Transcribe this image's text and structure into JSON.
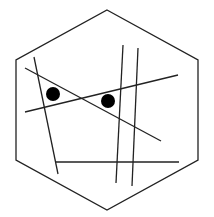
{
  "diagram": {
    "stroke_color": "#222222",
    "dot_color": "#000000",
    "background": "#ffffff",
    "hexagon": {
      "points": [
        [
          107,
          10
        ],
        [
          198,
          60
        ],
        [
          198,
          160
        ],
        [
          107,
          210
        ],
        [
          16,
          160
        ],
        [
          16,
          60
        ]
      ],
      "stroke_width": 1.3
    },
    "lines": [
      {
        "id": "line-a",
        "x1": 34,
        "y1": 57,
        "x2": 58,
        "y2": 174
      },
      {
        "id": "line-b",
        "x1": 25,
        "y1": 68,
        "x2": 161,
        "y2": 141
      },
      {
        "id": "line-c",
        "x1": 25,
        "y1": 112,
        "x2": 178,
        "y2": 75
      },
      {
        "id": "line-d",
        "x1": 123,
        "y1": 45,
        "x2": 116,
        "y2": 183
      },
      {
        "id": "line-e",
        "x1": 138,
        "y1": 48,
        "x2": 132,
        "y2": 186
      },
      {
        "id": "line-f",
        "x1": 56,
        "y1": 162,
        "x2": 179,
        "y2": 162
      }
    ],
    "line_width": 1.3,
    "dots": [
      {
        "id": "dot-1",
        "cx": 53,
        "cy": 94,
        "r": 7
      },
      {
        "id": "dot-2",
        "cx": 108,
        "cy": 101,
        "r": 7
      }
    ]
  }
}
